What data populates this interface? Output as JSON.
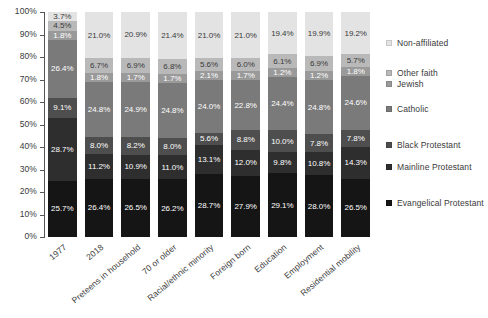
{
  "chart_data": {
    "type": "bar",
    "subtype": "stacked-100-percent",
    "title": "",
    "xlabel": "",
    "ylabel": "",
    "ylim": [
      0,
      100
    ],
    "grid": false,
    "legend_position": "right",
    "categories": [
      "1977",
      "2018",
      "Preteens in household",
      "70 or older",
      "Racial/ethnic minority",
      "Foreign born",
      "Education",
      "Employment",
      "Residential mobility"
    ],
    "ytick_labels": [
      "100%",
      "90%",
      "80%",
      "70%",
      "60%",
      "50%",
      "40%",
      "30%",
      "20%",
      "10%",
      "0%"
    ],
    "ytick_values": [
      100,
      90,
      80,
      70,
      60,
      50,
      40,
      30,
      20,
      10,
      0
    ],
    "series": [
      {
        "name": "Non-affiliated",
        "color": "#e3e3e3",
        "label_color": "#3a3a3a",
        "values": [
          3.7,
          21.0,
          20.9,
          21.4,
          21.0,
          21.0,
          19.4,
          19.9,
          19.2
        ],
        "labels": [
          "3.7%",
          "21.0%",
          "20.9%",
          "21.4%",
          "21.0%",
          "21.0%",
          "19.4%",
          "19.9%",
          "19.2%"
        ]
      },
      {
        "name": "Other faith",
        "color": "#b9b9b9",
        "label_color": "#3a3a3a",
        "values": [
          4.5,
          6.7,
          6.9,
          6.8,
          5.6,
          6.0,
          6.1,
          6.9,
          5.7
        ],
        "labels": [
          "4.5%",
          "6.7%",
          "6.9%",
          "6.8%",
          "5.6%",
          "6.0%",
          "6.1%",
          "6.9%",
          "5.7%"
        ]
      },
      {
        "name": "Jewish",
        "color": "#9a9a9a",
        "label_color": "#ffffff",
        "values": [
          1.8,
          1.8,
          1.7,
          1.7,
          2.1,
          1.7,
          1.2,
          1.2,
          1.8
        ],
        "labels": [
          "1.8%",
          "1.8%",
          "1.7%",
          "1.7%",
          "2.1%",
          "1.7%",
          "1.2%",
          "1.2%",
          "1.8%"
        ]
      },
      {
        "name": "Catholic",
        "color": "#7a7a7a",
        "label_color": "#ffffff",
        "values": [
          26.4,
          24.8,
          24.9,
          24.8,
          24.0,
          22.8,
          24.4,
          24.8,
          24.6
        ],
        "labels": [
          "26.4%",
          "24.8%",
          "24.9%",
          "24.8%",
          "24.0%",
          "22.8%",
          "24.4%",
          "24.8%",
          "24.6%"
        ]
      },
      {
        "name": "Black Protestant",
        "color": "#4e4e4e",
        "label_color": "#ffffff",
        "values": [
          9.1,
          8.0,
          8.2,
          8.0,
          5.6,
          8.8,
          10.0,
          7.8,
          7.8
        ],
        "labels": [
          "9.1%",
          "8.0%",
          "8.2%",
          "8.0%",
          "5.6%",
          "8.8%",
          "10.0%",
          "7.8%",
          "7.8%"
        ]
      },
      {
        "name": "Mainline Protestant",
        "color": "#2e2e2e",
        "label_color": "#ffffff",
        "values": [
          28.7,
          11.2,
          10.9,
          11.0,
          13.1,
          12.0,
          9.8,
          10.8,
          14.3
        ],
        "labels": [
          "28.7%",
          "11.2%",
          "10.9%",
          "11.0%",
          "13.1%",
          "12.0%",
          "9.8%",
          "10.8%",
          "14.3%"
        ]
      },
      {
        "name": "Evangelical Protestant",
        "color": "#151515",
        "label_color": "#ffffff",
        "values": [
          25.7,
          26.4,
          26.5,
          26.2,
          28.7,
          27.9,
          29.1,
          28.0,
          26.5
        ],
        "labels": [
          "25.7%",
          "26.4%",
          "26.5%",
          "26.2%",
          "28.7%",
          "27.9%",
          "29.1%",
          "28.0%",
          "26.5%"
        ]
      }
    ],
    "legend_entries": [
      {
        "label": "Non-affiliated",
        "color": "#e3e3e3",
        "top": 22
      },
      {
        "label": "Other faith",
        "color": "#b9b9b9",
        "top": 52
      },
      {
        "label": "Jewish",
        "color": "#9a9a9a",
        "top": 63
      },
      {
        "label": "Catholic",
        "color": "#7a7a7a",
        "top": 88
      },
      {
        "label": "Black Protestant",
        "color": "#4e4e4e",
        "top": 124
      },
      {
        "label": "Mainline Protestant",
        "color": "#2e2e2e",
        "top": 146
      },
      {
        "label": "Evangelical Protestant",
        "color": "#151515",
        "top": 182
      }
    ]
  }
}
